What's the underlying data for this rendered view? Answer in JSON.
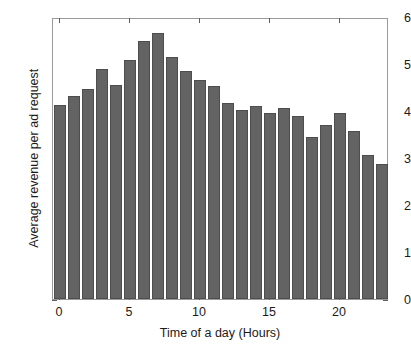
{
  "chart_data": {
    "type": "bar",
    "title": "",
    "xlabel": "Time of a day (Hours)",
    "ylabel": "Average revenue per ad request",
    "categories": [
      "0",
      "1",
      "2",
      "3",
      "4",
      "5",
      "6",
      "7",
      "8",
      "9",
      "10",
      "11",
      "12",
      "13",
      "14",
      "15",
      "16",
      "17",
      "18",
      "19",
      "20",
      "21",
      "22",
      "23"
    ],
    "values": [
      4.12,
      4.31,
      4.46,
      4.89,
      4.56,
      5.08,
      5.48,
      5.67,
      5.15,
      4.86,
      4.67,
      4.54,
      4.18,
      4.02,
      4.1,
      3.95,
      4.06,
      3.89,
      3.45,
      3.7,
      3.95,
      3.57,
      3.06,
      2.88
    ],
    "xlim": [
      -0.5,
      23.5
    ],
    "ylim": [
      0,
      6
    ],
    "ytick_labels": [
      "0",
      "1",
      "2",
      "3",
      "4",
      "5",
      "6"
    ],
    "ytick_values": [
      0,
      1,
      2,
      3,
      4,
      5,
      6
    ],
    "xtick_labels": [
      "0",
      "5",
      "10",
      "15",
      "20"
    ],
    "xtick_values": [
      0,
      5,
      10,
      15,
      20
    ],
    "grid": false,
    "legend": null,
    "bar_color": "#636363",
    "bar_edge_color": "#4d4d4d",
    "axis_color": "#9a9a9a",
    "background": "#ffffff"
  }
}
